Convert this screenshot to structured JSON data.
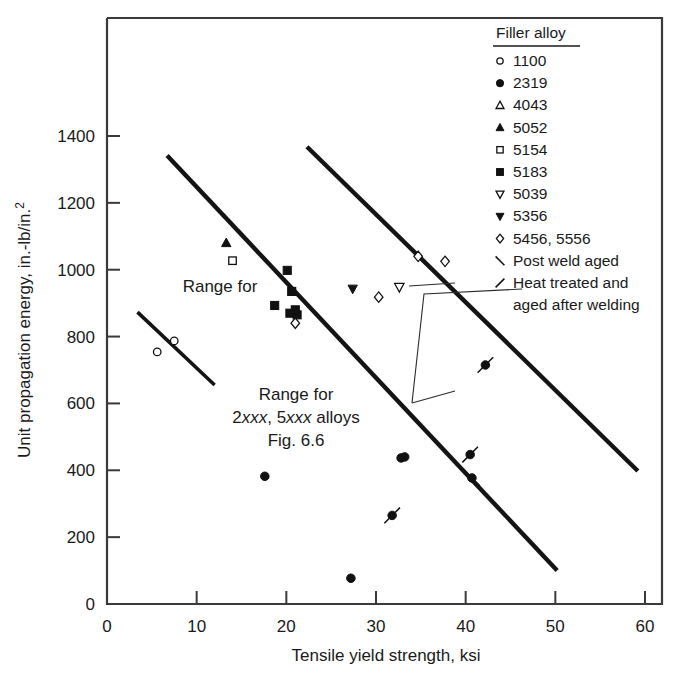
{
  "chart_data": {
    "type": "scatter",
    "title": "",
    "xlabel": "Tensile yield strength, ksi",
    "ylabel": "Unit propagation energy, in.-lb/in.2",
    "ylabel_display": "Unit propagation energy, in.-lb/in.",
    "ylabel_sup": "2",
    "xlim": [
      0,
      60
    ],
    "ylim": [
      0,
      1600
    ],
    "xticks": [
      0,
      10,
      20,
      30,
      40,
      50,
      60
    ],
    "yticks": [
      0,
      200,
      400,
      600,
      800,
      1000,
      1200,
      1400
    ],
    "grid": false,
    "legend_position": "top-right",
    "legend_title": "Filler alloy",
    "series": [
      {
        "name": "1100",
        "marker": "open-circle",
        "points": [
          [
            5.6,
            754
          ],
          [
            7.5,
            787
          ]
        ]
      },
      {
        "name": "2319",
        "marker": "filled-circle",
        "points": [
          [
            17.6,
            382
          ],
          [
            27.2,
            77
          ],
          [
            32.8,
            437
          ],
          [
            33.2,
            440
          ]
        ]
      },
      {
        "name": "4043",
        "marker": "open-triangle-up",
        "points": []
      },
      {
        "name": "5052",
        "marker": "filled-triangle-up",
        "points": [
          [
            13.3,
            1080
          ]
        ]
      },
      {
        "name": "5154",
        "marker": "open-square",
        "points": [
          [
            14.0,
            1027
          ]
        ]
      },
      {
        "name": "5183",
        "marker": "filled-square",
        "points": [
          [
            18.7,
            893
          ],
          [
            20.1,
            998
          ],
          [
            20.6,
            935
          ],
          [
            20.4,
            870
          ],
          [
            21.0,
            880
          ],
          [
            21.2,
            865
          ]
        ]
      },
      {
        "name": "5039",
        "marker": "open-triangle-down",
        "points": [
          [
            32.6,
            948
          ]
        ]
      },
      {
        "name": "5356",
        "marker": "filled-triangle-down",
        "points": [
          [
            27.4,
            943
          ]
        ]
      },
      {
        "name": "5456, 5556",
        "marker": "open-diamond",
        "points": [
          [
            21.0,
            840
          ],
          [
            30.3,
            918
          ],
          [
            34.7,
            1040
          ],
          [
            37.7,
            1025
          ]
        ]
      },
      {
        "name": "2319 post weld aged",
        "marker": "filled-circle-backslash",
        "points": [
          [
            40.7,
            377
          ]
        ]
      },
      {
        "name": "Heat treated and aged after welding",
        "marker": "filled-circle-slash",
        "points": [
          [
            31.8,
            265
          ],
          [
            40.5,
            447
          ],
          [
            42.2,
            715
          ]
        ]
      }
    ],
    "range_bands": [
      {
        "name": "Range for 1100 from Fig. 6.6",
        "x1": 3.4,
        "y1": 873,
        "x2": 12.0,
        "y2": 655
      },
      {
        "name": "Range for 2xxx, 5xxx alloys Fig. 6.6 upper bound",
        "x1": 6.7,
        "y1": 1342,
        "x2": 50.2,
        "y2": 100
      },
      {
        "name": "Range for 2xxx, 5xxx alloys Fig. 6.6 lower bound",
        "x1": 22.3,
        "y1": 1368,
        "x2": 59.2,
        "y2": 398
      }
    ],
    "annotations": [
      {
        "id": "range-1100",
        "line1": "Range for",
        "line2": "1100 from Fig. 6.6"
      },
      {
        "id": "range-2xxx",
        "line1": "Range for",
        "line2_a": "2",
        "line2_b": "xxx",
        "line2_c": ", 5",
        "line2_d": "xxx",
        "line2_e": " alloys",
        "line3": "Fig. 6.6"
      }
    ]
  },
  "legend": {
    "title": "Filler alloy",
    "items": [
      {
        "marker": "open-circle",
        "label": "1100"
      },
      {
        "marker": "filled-circle",
        "label": "2319"
      },
      {
        "marker": "open-triangle-up",
        "label": "4043"
      },
      {
        "marker": "filled-triangle-up",
        "label": "5052"
      },
      {
        "marker": "open-square",
        "label": "5154"
      },
      {
        "marker": "filled-square",
        "label": "5183"
      },
      {
        "marker": "open-triangle-down",
        "label": "5039"
      },
      {
        "marker": "filled-triangle-down",
        "label": "5356"
      },
      {
        "marker": "open-diamond",
        "label": "5456, 5556"
      },
      {
        "marker": "backslash",
        "label": "Post weld aged"
      },
      {
        "marker": "slash",
        "label": "Heat treated and"
      },
      {
        "marker": "none",
        "label": "aged after welding"
      }
    ]
  },
  "axes": {
    "x_title": "Tensile yield strength, ksi",
    "y_title_main": "Unit propagation energy, in.-lb/in.",
    "y_title_sup": "2",
    "x_ticks": [
      "0",
      "10",
      "20",
      "30",
      "40",
      "50",
      "60"
    ],
    "y_ticks": [
      "0",
      "200",
      "400",
      "600",
      "800",
      "1000",
      "1200",
      "1400"
    ],
    "y_origin_label": "0"
  },
  "colors": {
    "ink": "#1a1a1a",
    "axis": "#3a3a3a",
    "background": "#ffffff"
  }
}
